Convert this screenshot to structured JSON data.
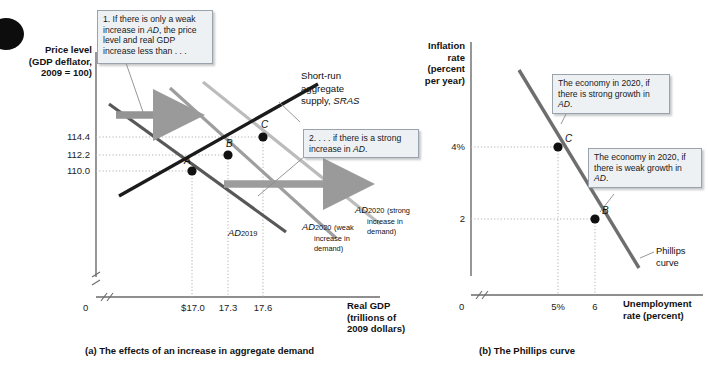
{
  "figure": {
    "panel_a": {
      "caption": "(a)  The effects of an increase in aggregate demand",
      "y_axis_title": [
        "Price level",
        "(GDP deflator,",
        "2009 = 100)"
      ],
      "x_axis_title": [
        "Real GDP",
        "(trillions of",
        "2009 dollars)"
      ],
      "origin_label": "0",
      "y_ticks": [
        "114.4",
        "112.2",
        "110.0"
      ],
      "x_ticks": [
        "$17.0",
        "17.3",
        "17.6"
      ],
      "points": [
        "A",
        "B",
        "C"
      ],
      "sras_label": [
        "Short-run",
        "aggregate",
        "supply, SRAS"
      ],
      "sras_label_italic": "SRAS",
      "ad2019_label": "AD",
      "ad2019_sub": "2019",
      "ad2020_strong": {
        "base": "AD",
        "sub": "2020",
        "note": [
          "(strong",
          "increase in",
          "demand)"
        ]
      },
      "ad2020_weak": {
        "base": "AD",
        "sub": "2020",
        "note": [
          "(weak",
          "increase in",
          "demand)"
        ]
      },
      "callout_1": "1. If there is only a weak increase in AD, the price level and real GDP increase less than . . .",
      "callout_2": "2. . . . if there is a strong increase in AD."
    },
    "panel_b": {
      "caption": "(b)  The Phillips curve",
      "y_axis_title": [
        "Inflation",
        "rate",
        "(percent",
        "per year)"
      ],
      "x_axis_title": [
        "Unemployment",
        "rate (percent)"
      ],
      "origin_label": "0",
      "y_ticks": [
        "4%",
        "2"
      ],
      "x_ticks": [
        "5%",
        "6"
      ],
      "points": [
        "C",
        "B"
      ],
      "curve_label": [
        "Phillips",
        "curve"
      ],
      "callout_strong": "The economy in 2020, if there is strong growth in AD.",
      "callout_weak": "The economy in 2020, if there is weak growth in AD."
    }
  },
  "colors": {
    "sras": "#1c1c1c",
    "ad2019": "#5c5c5c",
    "ad2020_weak": "#9a9a9a",
    "ad2020_strong": "#b9b9b9",
    "phillips": "#6e6e6e",
    "arrow": "#8e8e8e",
    "callout_bg": "#eef1f4",
    "callout_border": "#9aa3ab",
    "grid": "#b6b6b6",
    "axis": "#6a6a6a"
  },
  "chart_data": [
    {
      "type": "line",
      "id": "panel-a-ad-sras",
      "title": "(a) The effects of an increase in aggregate demand",
      "xlabel": "Real GDP (trillions of 2009 dollars)",
      "ylabel": "Price level (GDP deflator, 2009 = 100)",
      "xlim": [
        16.8,
        18.0
      ],
      "ylim": [
        106,
        120
      ],
      "grid": true,
      "legend": "inline curve labels",
      "series": [
        {
          "name": "Short-run aggregate supply, SRAS",
          "type": "line",
          "slope": "upward",
          "points": [
            [
              16.85,
              107.2
            ],
            [
              17.9,
              117.0
            ]
          ]
        },
        {
          "name": "AD2019",
          "type": "line",
          "slope": "downward",
          "points": [
            [
              16.82,
              117.5
            ],
            [
              17.62,
              108.0
            ]
          ]
        },
        {
          "name": "AD2020 (weak increase in demand)",
          "type": "line",
          "slope": "downward",
          "points": [
            [
              17.05,
              119.2
            ],
            [
              17.82,
              109.2
            ]
          ]
        },
        {
          "name": "AD2020 (strong increase in demand)",
          "type": "line",
          "slope": "downward",
          "points": [
            [
              17.22,
              119.6
            ],
            [
              17.95,
              110.4
            ]
          ]
        }
      ],
      "annotated_points": [
        {
          "label": "A",
          "x": 17.0,
          "y": 110.0
        },
        {
          "label": "B",
          "x": 17.3,
          "y": 112.2
        },
        {
          "label": "C",
          "x": 17.6,
          "y": 114.4
        }
      ],
      "xticks": [
        "$17.0",
        "17.3",
        "17.6"
      ],
      "yticks": [
        "114.4",
        "112.2",
        "110.0"
      ]
    },
    {
      "type": "line",
      "id": "panel-b-phillips",
      "title": "(b) The Phillips curve",
      "xlabel": "Unemployment rate (percent)",
      "ylabel": "Inflation rate (percent per year)",
      "xlim": [
        0,
        8.5
      ],
      "ylim": [
        0,
        7
      ],
      "grid": true,
      "series": [
        {
          "name": "Phillips curve",
          "type": "line",
          "slope": "downward",
          "points": [
            [
              4.0,
              6.2
            ],
            [
              7.0,
              1.0
            ]
          ]
        }
      ],
      "annotated_points": [
        {
          "label": "C",
          "x": 5.0,
          "y": 4.0
        },
        {
          "label": "B",
          "x": 6.0,
          "y": 2.0
        }
      ],
      "xticks": [
        "5%",
        "6"
      ],
      "yticks": [
        "4%",
        "2"
      ]
    }
  ]
}
